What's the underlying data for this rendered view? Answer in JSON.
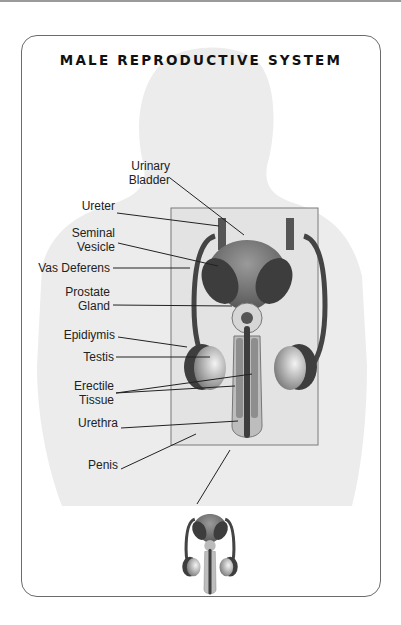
{
  "title": "MALE REPRODUCTIVE SYSTEM",
  "labels": {
    "urinary_bladder": [
      "Urinary",
      "Bladder"
    ],
    "ureter": "Ureter",
    "seminal_vesicle": [
      "Seminal",
      "Vesicle"
    ],
    "vas_deferens": "Vas Deferens",
    "prostate_gland": [
      "Prostate",
      "Gland"
    ],
    "epididymis": "Epidiymis",
    "testis": "Testis",
    "erectile_tissue": [
      "Erectile",
      "Tissue"
    ],
    "urethra": "Urethra",
    "penis": "Penis"
  },
  "colors": {
    "card_border": "#6b6b6b",
    "silhouette": "#ededed",
    "frame_fill": "#e4e4e4",
    "frame_border": "#7a7a7a",
    "dark_organ": "#4a4a4a",
    "mid_organ": "#8c8c8c",
    "light_organ": "#cfcfcf"
  }
}
